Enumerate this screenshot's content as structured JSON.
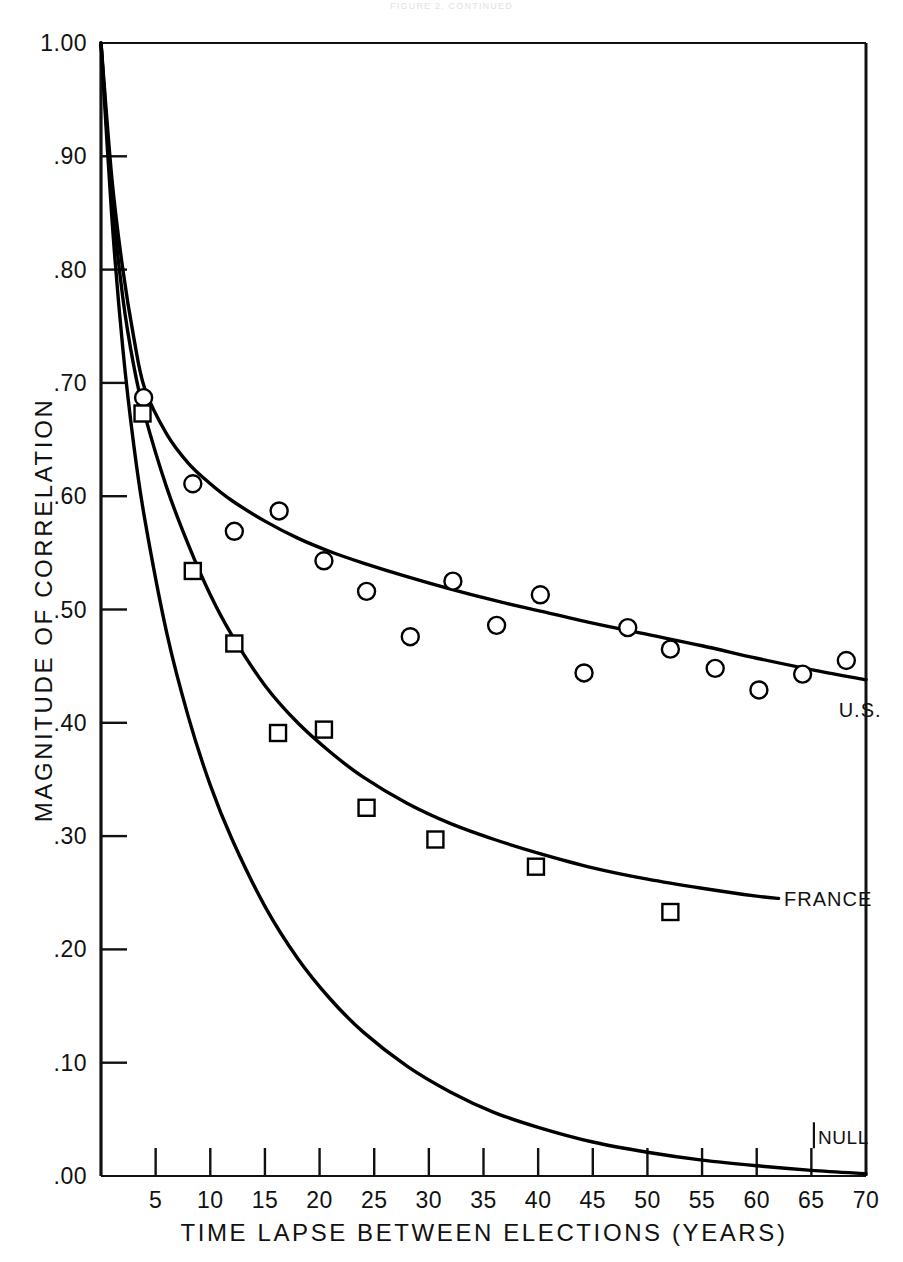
{
  "running_head": "FIGURE 2. CONTINUED",
  "chart_data": {
    "type": "scatter",
    "title": "",
    "subtitle": "",
    "xlabel": "TIME LAPSE BETWEEN ELECTIONS (YEARS)",
    "ylabel": "MAGNITUDE OF CORRELATION",
    "xlim": [
      0,
      70
    ],
    "ylim": [
      0.0,
      1.0
    ],
    "grid": false,
    "legend_position": "inline-right-end-of-curve",
    "x_ticks": [
      5,
      10,
      15,
      20,
      25,
      30,
      35,
      40,
      45,
      50,
      55,
      60,
      65,
      70
    ],
    "x_tick_labels": [
      "5",
      "10",
      "15",
      "20",
      "25",
      "30",
      "35",
      "40",
      "45",
      "50",
      "55",
      "60",
      "65",
      "70"
    ],
    "y_ticks": [
      0.0,
      0.1,
      0.2,
      0.3,
      0.4,
      0.5,
      0.6,
      0.7,
      0.8,
      0.9,
      1.0
    ],
    "y_tick_labels": [
      ".00",
      ".10",
      ".20",
      ".30",
      ".40",
      ".50",
      ".60",
      ".70",
      ".80",
      ".90",
      "1.00"
    ],
    "annotations": [
      {
        "text": "U.S.",
        "x": 67.5,
        "y": 0.405,
        "name": "us-curve-label"
      },
      {
        "text": "FRANCE",
        "x": 62.5,
        "y": 0.238,
        "name": "france-curve-label"
      },
      {
        "text": "NULL",
        "x": 65.6,
        "y": 0.028,
        "name": "null-curve-label"
      }
    ],
    "series": [
      {
        "name": "U.S.",
        "marker": "open-circle",
        "points": [
          {
            "x": 3.9,
            "y": 0.687
          },
          {
            "x": 8.4,
            "y": 0.611
          },
          {
            "x": 12.2,
            "y": 0.569
          },
          {
            "x": 16.3,
            "y": 0.587
          },
          {
            "x": 20.4,
            "y": 0.543
          },
          {
            "x": 24.3,
            "y": 0.516
          },
          {
            "x": 28.3,
            "y": 0.476
          },
          {
            "x": 32.2,
            "y": 0.525
          },
          {
            "x": 36.2,
            "y": 0.486
          },
          {
            "x": 40.2,
            "y": 0.513
          },
          {
            "x": 44.2,
            "y": 0.444
          },
          {
            "x": 48.2,
            "y": 0.484
          },
          {
            "x": 52.1,
            "y": 0.465
          },
          {
            "x": 56.2,
            "y": 0.448
          },
          {
            "x": 60.2,
            "y": 0.429
          },
          {
            "x": 64.2,
            "y": 0.443
          },
          {
            "x": 68.2,
            "y": 0.455
          }
        ],
        "fitted_curve": {
          "description": "monotone decaying fit through U.S. points",
          "x": [
            0,
            1,
            2,
            3,
            4,
            6,
            8,
            10,
            12,
            15,
            18,
            21,
            24,
            28,
            32,
            36,
            40,
            45,
            50,
            55,
            60,
            65,
            70
          ],
          "y": [
            1.0,
            0.88,
            0.8,
            0.74,
            0.695,
            0.655,
            0.629,
            0.611,
            0.596,
            0.578,
            0.563,
            0.551,
            0.541,
            0.529,
            0.518,
            0.508,
            0.499,
            0.488,
            0.478,
            0.468,
            0.457,
            0.447,
            0.438
          ]
        }
      },
      {
        "name": "FRANCE",
        "marker": "open-square",
        "points": [
          {
            "x": 3.8,
            "y": 0.673
          },
          {
            "x": 8.4,
            "y": 0.534
          },
          {
            "x": 12.2,
            "y": 0.47
          },
          {
            "x": 16.2,
            "y": 0.391
          },
          {
            "x": 20.4,
            "y": 0.394
          },
          {
            "x": 24.3,
            "y": 0.325
          },
          {
            "x": 30.6,
            "y": 0.297
          },
          {
            "x": 39.8,
            "y": 0.273
          },
          {
            "x": 52.1,
            "y": 0.233
          }
        ],
        "fitted_curve": {
          "description": "monotone decaying fit through France points",
          "x": [
            0,
            1,
            2,
            3,
            4,
            6,
            8,
            10,
            12,
            15,
            18,
            21,
            24,
            28,
            32,
            36,
            40,
            45,
            50,
            55,
            60,
            62
          ],
          "y": [
            1.0,
            0.865,
            0.775,
            0.715,
            0.672,
            0.608,
            0.557,
            0.513,
            0.477,
            0.433,
            0.4,
            0.374,
            0.352,
            0.329,
            0.311,
            0.297,
            0.285,
            0.272,
            0.262,
            0.254,
            0.247,
            0.245
          ]
        }
      },
      {
        "name": "NULL",
        "marker": "none",
        "points": [],
        "fitted_curve": {
          "description": "null / chance-expectation decay curve to zero",
          "x": [
            0,
            1,
            2,
            3,
            4,
            6,
            8,
            10,
            12,
            15,
            18,
            21,
            24,
            28,
            32,
            36,
            40,
            45,
            50,
            55,
            60,
            65,
            70
          ],
          "y": [
            1.0,
            0.845,
            0.73,
            0.645,
            0.58,
            0.48,
            0.405,
            0.345,
            0.297,
            0.238,
            0.192,
            0.156,
            0.127,
            0.097,
            0.074,
            0.056,
            0.043,
            0.03,
            0.021,
            0.014,
            0.009,
            0.005,
            0.002
          ]
        }
      }
    ]
  }
}
